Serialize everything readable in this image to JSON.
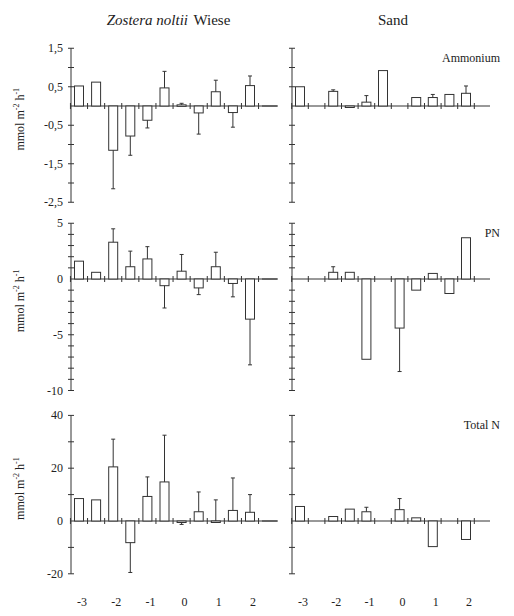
{
  "figure": {
    "column_titles": {
      "left_italic": "Zostera noltii",
      "left_plain": " Wiese",
      "right": "Sand"
    },
    "ylabel": "mmol m-2 h-1",
    "x_tick_labels": [
      "-3",
      "-2",
      "-1",
      "0",
      "1",
      "2"
    ]
  },
  "chart_data": [
    {
      "type": "bar",
      "panel": "top-left",
      "title": "",
      "column": "Zostera noltii Wiese",
      "ylabel": "mmol m-2 h-1",
      "xlabel": "",
      "ylim": [
        -2.5,
        1.5
      ],
      "yticks": [
        1.5,
        0.5,
        -0.5,
        -1.5,
        -2.5
      ],
      "x": [
        -3,
        -2.5,
        -2,
        -1.5,
        -1,
        -0.5,
        0,
        0.5,
        1,
        1.5,
        2
      ],
      "values": [
        0.52,
        0.62,
        -1.15,
        -0.78,
        -0.37,
        0.47,
        0.03,
        -0.18,
        0.37,
        -0.17,
        0.53
      ],
      "errors": [
        0,
        0,
        -2.15,
        -1.28,
        -0.57,
        0.9,
        0.07,
        -0.73,
        0.67,
        -0.55,
        0.78
      ]
    },
    {
      "type": "bar",
      "panel": "top-right",
      "title": "Ammonium",
      "column": "Sand",
      "ylim": [
        -2.5,
        1.5
      ],
      "x": [
        -3,
        -2,
        -1.5,
        -1,
        -0.5,
        0.5,
        1,
        1.5,
        2
      ],
      "values": [
        0.5,
        0.38,
        -0.03,
        0.1,
        0.92,
        0.22,
        0.22,
        0.3,
        0.33
      ],
      "errors": [
        0,
        0.42,
        0,
        0.27,
        0,
        0,
        0.3,
        0,
        0.52
      ]
    },
    {
      "type": "bar",
      "panel": "middle-left",
      "title": "",
      "column": "Zostera noltii Wiese",
      "ylabel": "mmol m-2 h-1",
      "ylim": [
        -10,
        5
      ],
      "yticks": [
        5,
        0,
        -5,
        -10
      ],
      "x": [
        -3,
        -2.5,
        -2,
        -1.5,
        -1,
        -0.5,
        0,
        0.5,
        1,
        1.5,
        2
      ],
      "values": [
        1.6,
        0.6,
        3.3,
        1.1,
        1.8,
        -0.6,
        0.7,
        -0.8,
        1.1,
        -0.4,
        -3.6
      ],
      "errors": [
        0,
        0,
        4.5,
        2.5,
        2.9,
        -2.6,
        2.2,
        -1.4,
        2.4,
        -1.6,
        -7.7
      ]
    },
    {
      "type": "bar",
      "panel": "middle-right",
      "title": "PN",
      "column": "Sand",
      "ylim": [
        -10,
        5
      ],
      "x": [
        -2,
        -1.5,
        -1,
        0,
        0.5,
        1,
        1.5,
        2
      ],
      "values": [
        0.6,
        0.6,
        -7.2,
        -4.4,
        -1.0,
        0.5,
        -1.3,
        3.7
      ],
      "errors": [
        1.1,
        0,
        0,
        -8.3,
        0,
        0,
        0,
        0
      ]
    },
    {
      "type": "bar",
      "panel": "bottom-left",
      "title": "",
      "column": "Zostera noltii Wiese",
      "ylabel": "mmol m-2 h-1",
      "ylim": [
        -20,
        40
      ],
      "yticks": [
        40,
        20,
        0,
        -20
      ],
      "xticklabels": [
        "-3",
        "-2",
        "-1",
        "0",
        "1",
        "2"
      ],
      "x": [
        -3,
        -2.5,
        -2,
        -1.5,
        -1,
        -0.5,
        0,
        0.5,
        1,
        1.5,
        2
      ],
      "values": [
        8.5,
        8,
        20.5,
        -8.2,
        9.3,
        14.8,
        -0.5,
        3.5,
        0,
        4,
        3.3
      ],
      "errors": [
        0,
        0,
        31,
        -19.5,
        16.7,
        32.5,
        -1.3,
        11,
        8,
        16.3,
        10
      ]
    },
    {
      "type": "bar",
      "panel": "bottom-right",
      "title": "Total N",
      "column": "Sand",
      "ylim": [
        -20,
        40
      ],
      "xticklabels": [
        "-3",
        "-2",
        "-1",
        "0",
        "1",
        "2"
      ],
      "x": [
        -3,
        -2,
        -1.5,
        -1,
        0,
        0.5,
        1,
        2
      ],
      "values": [
        5.5,
        1.7,
        4.5,
        3.5,
        4.3,
        1.2,
        -9.7,
        -7.0
      ],
      "errors": [
        0,
        0,
        0,
        5.2,
        8.5,
        0,
        0,
        0
      ]
    }
  ]
}
